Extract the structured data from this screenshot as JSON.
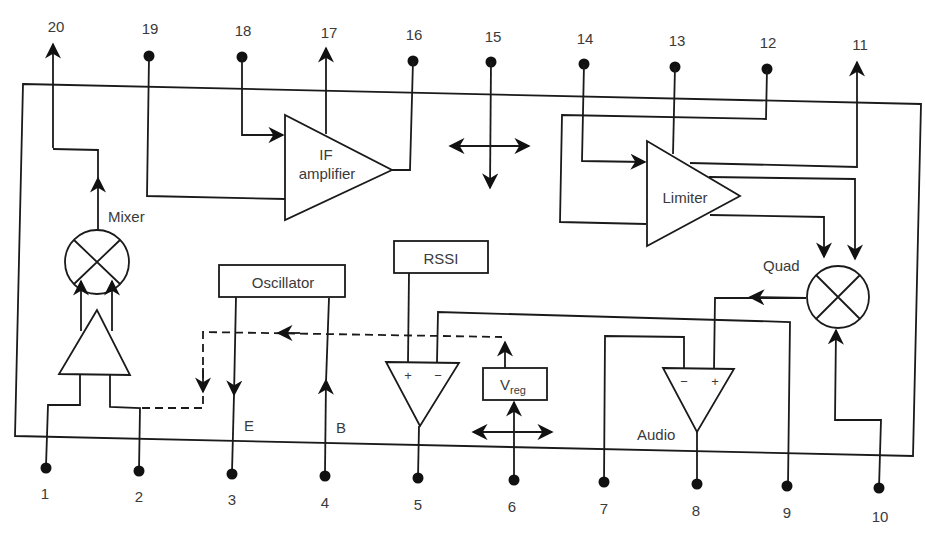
{
  "diagram": {
    "type": "FM receiver IC block diagram",
    "colors": {
      "line": "#1a1a1a",
      "text": "#3a3a3a",
      "background": "#ffffff"
    },
    "pins": {
      "top": [
        {
          "id": "p20",
          "label": "20",
          "kind": "output-arrow"
        },
        {
          "id": "p19",
          "label": "19",
          "kind": "terminal"
        },
        {
          "id": "p18",
          "label": "18",
          "kind": "terminal"
        },
        {
          "id": "p17",
          "label": "17",
          "kind": "output-arrow"
        },
        {
          "id": "p16",
          "label": "16",
          "kind": "terminal"
        },
        {
          "id": "p15",
          "label": "15",
          "kind": "terminal"
        },
        {
          "id": "p14",
          "label": "14",
          "kind": "terminal"
        },
        {
          "id": "p13",
          "label": "13",
          "kind": "terminal"
        },
        {
          "id": "p12",
          "label": "12",
          "kind": "terminal"
        },
        {
          "id": "p11",
          "label": "11",
          "kind": "output-arrow"
        }
      ],
      "bottom": [
        {
          "id": "p1",
          "label": "1"
        },
        {
          "id": "p2",
          "label": "2"
        },
        {
          "id": "p3",
          "label": "3"
        },
        {
          "id": "p4",
          "label": "4"
        },
        {
          "id": "p5",
          "label": "5"
        },
        {
          "id": "p6",
          "label": "6"
        },
        {
          "id": "p7",
          "label": "7"
        },
        {
          "id": "p8",
          "label": "8"
        },
        {
          "id": "p9",
          "label": "9"
        },
        {
          "id": "p10",
          "label": "10"
        }
      ]
    },
    "blocks": {
      "if_amp_line1": "IF",
      "if_amp_line2": "amplifier",
      "limiter": "Limiter",
      "mixer": "Mixer",
      "oscillator": "Oscillator",
      "rssi": "RSSI",
      "vreg_main": "V",
      "vreg_sub": "reg",
      "quad": "Quad",
      "audio": "Audio"
    },
    "oscillator_terminals": {
      "emitter": "E",
      "base": "B"
    },
    "opamp_signs": {
      "plus": "+",
      "minus": "−"
    }
  }
}
